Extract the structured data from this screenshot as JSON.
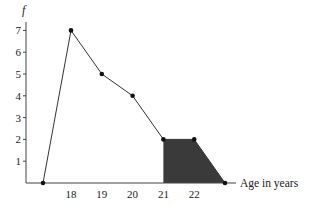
{
  "chart_data": {
    "type": "line",
    "subtype": "frequency polygon",
    "title": "",
    "xlabel": "Age in years",
    "ylabel": "f",
    "x": [
      17,
      18,
      19,
      20,
      21,
      22,
      23
    ],
    "values": [
      0,
      7,
      5,
      4,
      2,
      2,
      0
    ],
    "x_tick_labels": [
      "18",
      "19",
      "20",
      "21",
      "22"
    ],
    "y_tick_labels": [
      "1",
      "2",
      "3",
      "4",
      "5",
      "6",
      "7"
    ],
    "ylim": [
      0,
      7
    ],
    "grid": false,
    "legend": null,
    "shaded_region": {
      "from_x": 21,
      "to_x": 23,
      "description": "area under polygon from age 21 onward shaded dark grey"
    },
    "colors": {
      "line": "#333333",
      "shade": "#3a3a3a",
      "axis": "#444444"
    }
  }
}
